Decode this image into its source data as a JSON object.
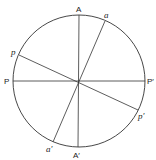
{
  "diagram": {
    "circle": {
      "cx": 79,
      "cy": 81,
      "r": 66,
      "stroke": "#333333"
    },
    "lines": [
      {
        "name": "axis-A-A-prime",
        "x1": 79,
        "y1": 15,
        "x2": 78,
        "y2": 147
      },
      {
        "name": "axis-P-P-prime",
        "x1": 13,
        "y1": 81,
        "x2": 145,
        "y2": 81
      },
      {
        "name": "axis-a-a-prime",
        "x1": 105,
        "y1": 21,
        "x2": 53,
        "y2": 142
      },
      {
        "name": "axis-p-p-prime",
        "x1": 19,
        "y1": 55,
        "x2": 138,
        "y2": 110
      }
    ],
    "labels": {
      "A": "A",
      "A_prime": "A′",
      "a": "a",
      "a_prime": "a′",
      "P": "P",
      "P_prime": "P′",
      "p": "p",
      "p_prime": "p′"
    }
  }
}
